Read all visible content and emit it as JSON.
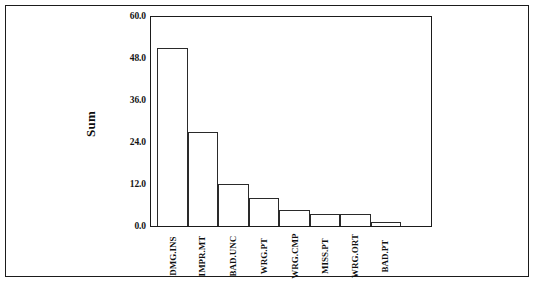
{
  "chart_data": {
    "type": "bar",
    "title": "",
    "xlabel": "",
    "ylabel": "Sum",
    "ylim": [
      0,
      60
    ],
    "yticks": [
      "0.0",
      "12.0",
      "24.0",
      "36.0",
      "48.0",
      "60.0"
    ],
    "ytick_values": [
      0,
      12,
      24,
      36,
      48,
      60
    ],
    "grid": false,
    "legend": null,
    "categories": [
      "DMG.INS",
      "IMPR.MT",
      "BAD.UNC",
      "WRG.PT",
      "WRG.CMP",
      "MISS.PT",
      "WRG.ORT",
      "BAD.PT"
    ],
    "values": [
      51,
      27,
      12,
      8,
      4.5,
      3.4,
      3.4,
      1.1
    ],
    "bar_fill": "#ffffff",
    "bar_edge": "#2a2a2a"
  },
  "figure": {
    "axis_color": "#1b1b1b",
    "background": "#ffffff",
    "border_color": "#1b1b1b"
  }
}
